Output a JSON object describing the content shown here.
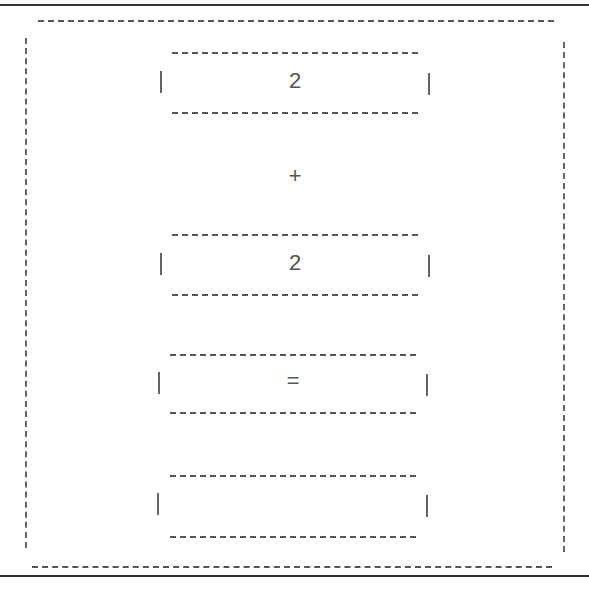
{
  "calculator": {
    "operand_a": "2",
    "operator": "+",
    "operand_b": "2",
    "equals_label": "=",
    "result": ""
  },
  "colors": {
    "line": "#555555",
    "rule": "#333333",
    "background": "#ffffff"
  }
}
